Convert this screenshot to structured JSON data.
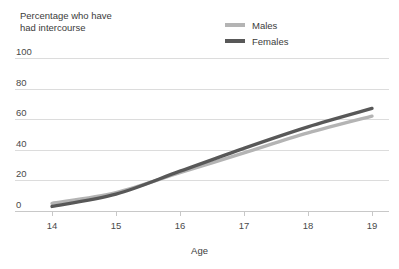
{
  "chart_data": {
    "type": "line",
    "title": "",
    "ylabel": "Percentage who have\nhad intercourse",
    "xlabel": "Age",
    "x": [
      14,
      15,
      16,
      17,
      18,
      19
    ],
    "xtick_labels": [
      "14",
      "15",
      "16",
      "17",
      "18",
      "19"
    ],
    "ytick_labels": [
      "0",
      "20",
      "40",
      "60",
      "80",
      "100"
    ],
    "yticks": [
      0,
      20,
      40,
      60,
      80,
      100
    ],
    "ylim": [
      0,
      100
    ],
    "xlim": [
      14,
      19
    ],
    "grid": "horizontal",
    "legend_position": "top-center",
    "series": [
      {
        "name": "Males",
        "color": "#b4b4b4",
        "values": [
          5,
          12,
          25,
          38,
          51,
          62
        ]
      },
      {
        "name": "Females",
        "color": "#585858",
        "values": [
          3,
          11,
          26,
          41,
          55,
          67
        ]
      }
    ]
  },
  "legend": {
    "items": [
      {
        "label": "Males",
        "color": "#b4b4b4"
      },
      {
        "label": "Females",
        "color": "#585858"
      }
    ]
  },
  "axes": {
    "y_title": "Percentage who have\nhad intercourse",
    "x_title": "Age"
  },
  "colors": {
    "background": "#ffffff",
    "gridline": "#dcdcdc",
    "axis": "#c8c8c8",
    "text": "#3b3b3b",
    "males": "#b4b4b4",
    "females": "#585858"
  }
}
